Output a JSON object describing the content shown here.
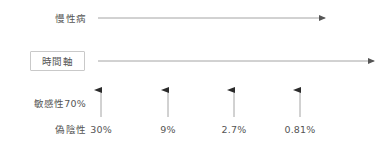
{
  "diagram": {
    "type": "timeline-false-negative",
    "background_color": "#ffffff",
    "line_color": "#9a9a9a",
    "text_color": "#555555",
    "box_border_color": "#c9c9c9",
    "rows": {
      "chronic_label": "慢性病",
      "timeline_label": "時間軸",
      "sensitivity_label": "敏感性70%",
      "false_negative_label": "偽陰性"
    },
    "arrows": {
      "chronic_arrow": "horizontal-right-arrow",
      "timeline_arrow": "horizontal-right-arrow",
      "tick_arrow": "vertical-up-arrow"
    },
    "ticks": [
      {
        "value": "30%",
        "x": 101
      },
      {
        "value": "9%",
        "x": 168
      },
      {
        "value": "2.7%",
        "x": 234
      },
      {
        "value": "0.81%",
        "x": 300
      }
    ]
  }
}
